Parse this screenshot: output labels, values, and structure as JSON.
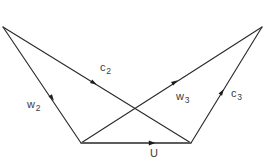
{
  "figure": {
    "kind": "geometric-diagram",
    "width": 265,
    "height": 166,
    "background_color": "#ffffff",
    "edge_color": "#2b2b2b",
    "base_edge_color": "#5d5d5d",
    "label_color": "#3a3a3a"
  },
  "vertices": {
    "top_left": {
      "name": "top-left-apex",
      "x": 3,
      "y": 27
    },
    "top_right": {
      "name": "top-right-apex",
      "x": 262,
      "y": 27
    },
    "bottom_left": {
      "name": "bottom-left-vertex",
      "x": 81,
      "y": 143
    },
    "bottom_right": {
      "name": "bottom-right-vertex",
      "x": 191,
      "y": 143
    },
    "crossing": {
      "name": "edge-crossing-point",
      "x": 137,
      "y": 110
    }
  },
  "edges": [
    {
      "id": "w2",
      "label": "w",
      "subscript": "2",
      "from": "top_left",
      "to": "bottom_left",
      "x1": 3,
      "y1": 27,
      "x2": 81,
      "y2": 143,
      "arrow_x": 52,
      "arrow_y": 98,
      "arrow_angle": 56,
      "label_x": 27,
      "label_y": 99
    },
    {
      "id": "c2",
      "label": "c",
      "subscript": "2",
      "from": "top_left",
      "to": "bottom_right",
      "x1": 3,
      "y1": 27,
      "x2": 191,
      "y2": 143,
      "arrow_x": 94,
      "arrow_y": 83,
      "arrow_angle": 32,
      "label_x": 100,
      "label_y": 62
    },
    {
      "id": "w3",
      "label": "w",
      "subscript": "3",
      "from": "bottom_left",
      "to": "top_right",
      "x1": 81,
      "y1": 143,
      "x2": 262,
      "y2": 27,
      "arrow_x": 175,
      "arrow_y": 82,
      "arrow_angle": -33,
      "label_x": 176,
      "label_y": 91
    },
    {
      "id": "c3",
      "label": "c",
      "subscript": "3",
      "from": "bottom_right",
      "to": "top_right",
      "x1": 191,
      "y1": 143,
      "x2": 262,
      "y2": 27,
      "arrow_x": 222,
      "arrow_y": 92,
      "arrow_angle": -58,
      "label_x": 231,
      "label_y": 88
    },
    {
      "id": "U",
      "label": "U",
      "subscript": "",
      "from": "bottom_left",
      "to": "bottom_right",
      "x1": 81,
      "y1": 143,
      "x2": 191,
      "y2": 143,
      "arrow_x": 152,
      "arrow_y": 143,
      "arrow_angle": 0,
      "label_x": 150,
      "label_y": 148
    }
  ]
}
